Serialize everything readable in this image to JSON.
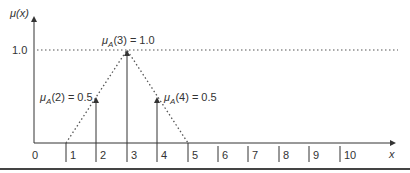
{
  "figure": {
    "type": "triangular-membership-function",
    "y_axis_label": "μ(x)",
    "x_axis_label": "x",
    "one_level_label": "1.0",
    "x_ticks": [
      "0",
      "1",
      "2",
      "3",
      "4",
      "5",
      "6",
      "7",
      "8",
      "9",
      "10"
    ],
    "annotations": [
      {
        "text_mu": "μ",
        "sub": "A",
        "arg": "(3) = 1.0",
        "x": 3,
        "value": 1.0
      },
      {
        "text_mu": "μ",
        "sub": "A",
        "arg": "(2) = 0.5",
        "x": 2,
        "value": 0.5
      },
      {
        "text_mu": "μ",
        "sub": "A",
        "arg": "(4) = 0.5",
        "x": 4,
        "value": 0.5
      }
    ],
    "triangle": {
      "left": 1,
      "peak": 3,
      "right": 5
    },
    "colors": {
      "line": "#333333",
      "dotted": "#555555",
      "rule": "#444444"
    }
  }
}
